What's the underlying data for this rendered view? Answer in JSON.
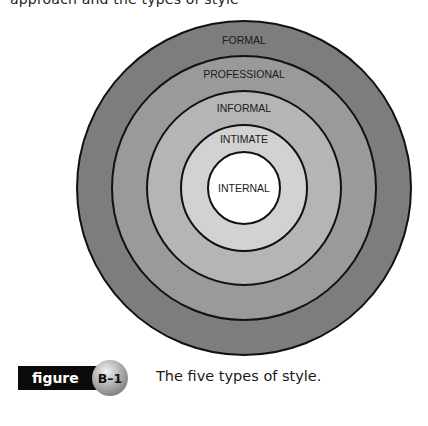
{
  "page": {
    "top_cut_text": "approach and the types of style"
  },
  "diagram": {
    "title": "The five types of style",
    "center": {
      "x": 244,
      "y": 188
    },
    "rings": [
      {
        "label": "FORMAL",
        "radius": 167,
        "fill": "#7d7d7d",
        "label_y": 44
      },
      {
        "label": "PROFESSIONAL",
        "radius": 132,
        "fill": "#9a9a9a",
        "label_y": 78
      },
      {
        "label": "INFORMAL",
        "radius": 97,
        "fill": "#b5b5b5",
        "label_y": 112
      },
      {
        "label": "INTIMATE",
        "radius": 63,
        "fill": "#d2d2d2",
        "label_y": 143
      },
      {
        "label": "INTERNAL",
        "radius": 36,
        "fill": "#ffffff",
        "label_y": 192
      }
    ],
    "stroke_color": "#111111"
  },
  "figure": {
    "tag_label": "figure",
    "number": "B–1",
    "caption": "The five types of style."
  }
}
